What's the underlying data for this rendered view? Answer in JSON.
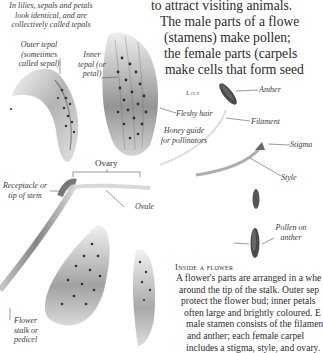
{
  "intro_note": {
    "lines": [
      "In lilies, sepals and petals",
      "look identical, and are",
      "collectively called tepals"
    ]
  },
  "main_text": {
    "lines": [
      "to attract visiting animals.",
      "The male parts of a flowe",
      "(stamens) make pollen;",
      "the female parts (carpels",
      "make cells that form seed"
    ]
  },
  "labels": {
    "outer_tepal": [
      "Outer tepal (sometimes",
      "called sepal)"
    ],
    "inner_tepal": [
      "Inner",
      "tepal (or",
      "petal)"
    ],
    "lily": "Lily",
    "anther": "Anther",
    "fleshy_hair": "Fleshy hair",
    "honey_guide": [
      "Honey guide",
      "for pollinators"
    ],
    "filament": "Filament",
    "stigma": "Stigma",
    "style": "Style",
    "ovary": "Ovary",
    "receptacle": [
      "Receptacle or",
      "tip of stem"
    ],
    "ovule": "Ovule",
    "pollen": [
      "Pollen on",
      "anther"
    ],
    "flower_stalk": [
      "Flower",
      "stalk or",
      "pedicel"
    ]
  },
  "caption": {
    "heading": "Inside a flower",
    "lines": [
      "A flower's parts are arranged in a whe",
      "around the tip of the stalk. Outer sep",
      "protect the flower bud; inner petals",
      "often large and brightly coloured. E",
      "male stamen consists of the filamen",
      "and anther; each female carpel",
      "includes a stigma, style, and ovary."
    ]
  },
  "colors": {
    "text": "#2a2a2a",
    "illustration_dark": "#3b3b3b",
    "illustration_mid": "#8a8a8a",
    "illustration_light": "#d4d4d4"
  }
}
